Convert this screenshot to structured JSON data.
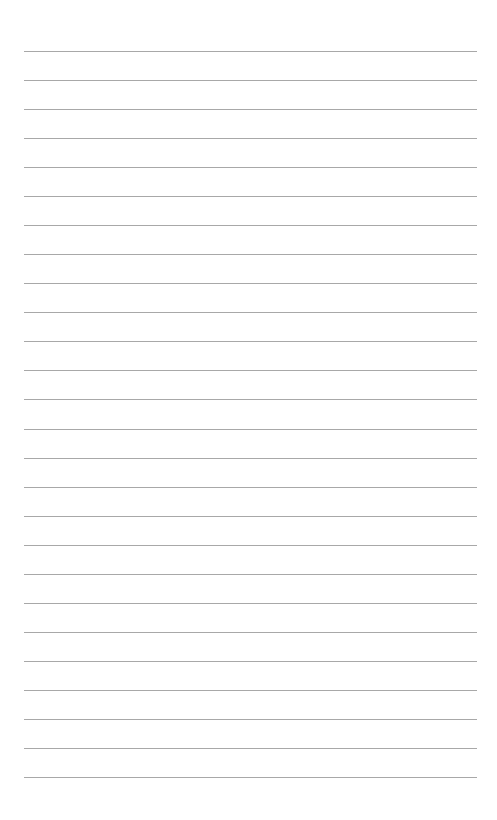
{
  "page": {
    "type": "lined-paper",
    "line_count": 26,
    "first_line_y": 51,
    "line_spacing": 29.04,
    "line_left": 24,
    "line_right": 477,
    "line_color": "#a8a8a8",
    "background_color": "#ffffff"
  }
}
